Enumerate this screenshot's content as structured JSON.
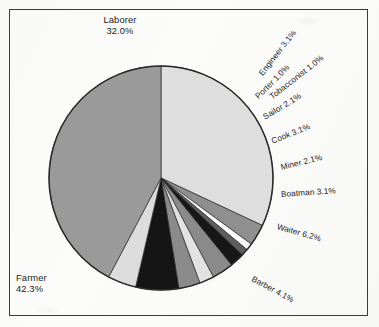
{
  "chart_data": {
    "type": "pie",
    "title": "",
    "subtitle": "",
    "xlabel": "",
    "ylabel": "",
    "legend_position": "none",
    "grid": false,
    "label_format": "{name} {percent}%",
    "start_angle_deg": 0,
    "direction": "clockwise",
    "categories": [
      "Laborer",
      "Engineer",
      "Porter",
      "Tobacconist",
      "Sailor",
      "Cook",
      "Miner",
      "Boatman",
      "Waiter",
      "Barber",
      "Farmer"
    ],
    "values": [
      32.0,
      3.1,
      1.0,
      1.0,
      2.1,
      3.1,
      2.1,
      3.1,
      6.2,
      4.1,
      42.3
    ],
    "slices": [
      {
        "name": "Laborer",
        "percent": 32.0,
        "label": "Laborer",
        "value_label": "32.0%",
        "color": "#dedede",
        "label_style": "block",
        "label_rotation": 0
      },
      {
        "name": "Engineer",
        "percent": 3.1,
        "label": "Engineer 3.1%",
        "value_label": "3.1%",
        "color": "#8f8f8f",
        "label_style": "rotated",
        "label_rotation": -52
      },
      {
        "name": "Porter",
        "percent": 1.0,
        "label": "Porter 1.0%",
        "value_label": "1.0%",
        "color": "#fbfbfb",
        "label_style": "rotated",
        "label_rotation": -45
      },
      {
        "name": "Tobacconist",
        "percent": 1.0,
        "label": "Tobacconist 1.0%",
        "value_label": "1.0%",
        "color": "#5e5e5e",
        "label_style": "rotated",
        "label_rotation": -38
      },
      {
        "name": "Sailor",
        "percent": 2.1,
        "label": "Sailor 2.1%",
        "value_label": "2.1%",
        "color": "#171717",
        "label_style": "rotated",
        "label_rotation": -31
      },
      {
        "name": "Cook",
        "percent": 3.1,
        "label": "Cook 3.1%",
        "value_label": "3.1%",
        "color": "#8a8a8a",
        "label_style": "rotated",
        "label_rotation": -22
      },
      {
        "name": "Miner",
        "percent": 2.1,
        "label": "Miner 2.1%",
        "value_label": "2.1%",
        "color": "#e2e2e2",
        "label_style": "rotated",
        "label_rotation": -14
      },
      {
        "name": "Boatman",
        "percent": 3.1,
        "label": "Boatman 3.1%",
        "value_label": "3.1%",
        "color": "#8a8a8a",
        "label_style": "rotated",
        "label_rotation": -4
      },
      {
        "name": "Waiter",
        "percent": 6.2,
        "label": "Waiter 6.2%",
        "value_label": "6.2%",
        "color": "#151515",
        "label_style": "rotated",
        "label_rotation": 16
      },
      {
        "name": "Barber",
        "percent": 4.1,
        "label": "Barber 4.1%",
        "value_label": "4.1%",
        "color": "#dcdcdc",
        "label_style": "rotated",
        "label_rotation": 28
      },
      {
        "name": "Farmer",
        "percent": 42.3,
        "label": "Farmer",
        "value_label": "42.3%",
        "color": "#9a9a9a",
        "label_style": "block",
        "label_rotation": 0
      }
    ]
  },
  "labels": {
    "laborer_name": "Laborer",
    "laborer_value": "32.0%",
    "farmer_name": "Farmer",
    "farmer_value": "42.3%",
    "engineer": "Engineer 3.1%",
    "porter": "Porter 1.0%",
    "tobacconist": "Tobacconist 1.0%",
    "sailor": "Sailor 2.1%",
    "cook": "Cook 3.1%",
    "miner": "Miner 2.1%",
    "boatman": "Boatman 3.1%",
    "waiter": "Waiter 6.2%",
    "barber": "Barber 4.1%"
  },
  "style": {
    "border_color": "#3b3b3b",
    "slice_outline_color": "#2a2a2a",
    "text_color": "#1b1b1b",
    "background": "#fcfcfb"
  },
  "geometry": {
    "center_x": 161,
    "center_y": 178,
    "radius": 112
  }
}
